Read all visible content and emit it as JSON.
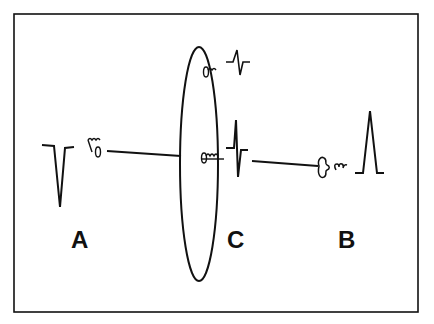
{
  "diagram": {
    "type": "electrode-dipole-illustration",
    "labels": {
      "a": "A",
      "b": "B",
      "c": "C"
    },
    "colors": {
      "stroke": "#111111",
      "background": "#ffffff"
    },
    "elements": [
      {
        "id": "waveform-a",
        "description": "negative (downward) deflection"
      },
      {
        "id": "waveform-c-top",
        "description": "small biphasic deflection"
      },
      {
        "id": "waveform-c-middle",
        "description": "large biphasic deflection (up then down)"
      },
      {
        "id": "waveform-b",
        "description": "positive (upward) deflection"
      },
      {
        "id": "ellipse",
        "description": "plane of activation wavefront"
      }
    ]
  }
}
